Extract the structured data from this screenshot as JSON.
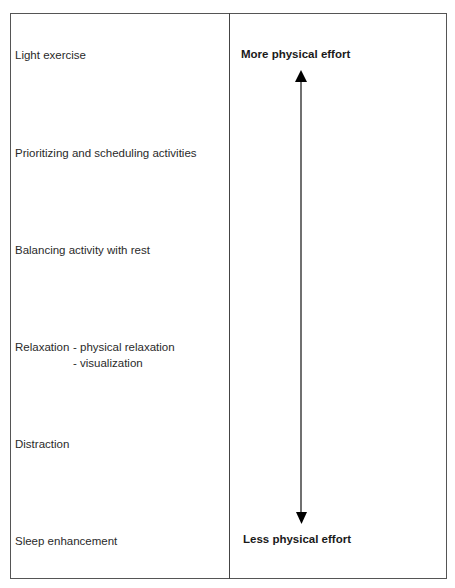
{
  "diagram": {
    "left_column": {
      "items": [
        {
          "label": "Light exercise"
        },
        {
          "label": "Prioritizing and scheduling activities"
        },
        {
          "label": "Balancing activity with rest"
        },
        {
          "label": "Relaxation",
          "sub_items": [
            "-  physical relaxation",
            "-  visualization"
          ]
        },
        {
          "label": "Distraction"
        },
        {
          "label": "Sleep enhancement"
        }
      ]
    },
    "right_column": {
      "top_label": "More physical effort",
      "bottom_label": "Less physical effort",
      "arrow": "double-headed vertical arrow"
    },
    "colors": {
      "border": "#555555",
      "text": "#2a2a2a",
      "arrow": "#000000"
    }
  }
}
